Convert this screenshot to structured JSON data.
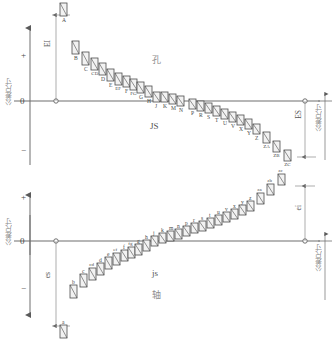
{
  "diagram": {
    "title_hole": "孔",
    "title_shaft": "轴",
    "axis_vertical_label": "公差尺寸",
    "zero_label": "0",
    "plus_label": "+",
    "minus_label": "−"
  },
  "hole": {
    "section_label": "孔",
    "js_label": "JS",
    "lower_dev_label": "EI",
    "upper_dev_label": "ES",
    "left_axis_label": "公差尺寸",
    "right_axis_label": "公差尺寸",
    "zero": "0",
    "plus": "+",
    "minus": "−",
    "zones": [
      {
        "letter": "A",
        "x": 60,
        "top": 3,
        "h": 13
      },
      {
        "letter": "B",
        "x": 72,
        "top": 41,
        "h": 13
      },
      {
        "letter": "C",
        "x": 82,
        "top": 52,
        "h": 13
      },
      {
        "letter": "CD",
        "x": 91,
        "top": 58,
        "h": 12
      },
      {
        "letter": "D",
        "x": 99,
        "top": 63,
        "h": 12
      },
      {
        "letter": "E",
        "x": 107,
        "top": 69,
        "h": 12
      },
      {
        "letter": "EF",
        "x": 115,
        "top": 73,
        "h": 12
      },
      {
        "letter": "F",
        "x": 123,
        "top": 76,
        "h": 11
      },
      {
        "letter": "FG",
        "x": 130,
        "top": 79,
        "h": 11
      },
      {
        "letter": "G",
        "x": 137,
        "top": 82,
        "h": 11
      },
      {
        "letter": "H",
        "x": 145,
        "top": 86,
        "h": 11
      },
      {
        "letter": "J",
        "x": 153,
        "top": 92,
        "h": 10
      },
      {
        "letter": "K",
        "x": 161,
        "top": 92,
        "h": 10
      },
      {
        "letter": "M",
        "x": 169,
        "top": 94,
        "h": 10
      },
      {
        "letter": "N",
        "x": 177,
        "top": 96,
        "h": 10
      },
      {
        "letter": "P",
        "x": 189,
        "top": 99,
        "h": 10
      },
      {
        "letter": "R",
        "x": 197,
        "top": 101,
        "h": 10
      },
      {
        "letter": "S",
        "x": 205,
        "top": 103,
        "h": 10
      },
      {
        "letter": "T",
        "x": 213,
        "top": 106,
        "h": 10
      },
      {
        "letter": "U",
        "x": 221,
        "top": 109,
        "h": 10
      },
      {
        "letter": "V",
        "x": 229,
        "top": 112,
        "h": 10
      },
      {
        "letter": "X",
        "x": 237,
        "top": 115,
        "h": 10
      },
      {
        "letter": "Y",
        "x": 245,
        "top": 119,
        "h": 10
      },
      {
        "letter": "Z",
        "x": 253,
        "top": 124,
        "h": 10
      },
      {
        "letter": "ZA",
        "x": 263,
        "top": 132,
        "h": 11
      },
      {
        "letter": "ZB",
        "x": 273,
        "top": 141,
        "h": 11
      },
      {
        "letter": "ZC",
        "x": 284,
        "top": 150,
        "h": 11
      }
    ]
  },
  "shaft": {
    "section_label": "轴",
    "js_label": "js",
    "upper_dev_label": "es",
    "lower_dev_label": "ei",
    "left_axis_label": "公差尺寸",
    "right_axis_label": "公差尺寸",
    "zero": "0",
    "plus": "+",
    "minus": "−",
    "zones": [
      {
        "letter": "a",
        "x": 60,
        "top": 325,
        "h": 13
      },
      {
        "letter": "b",
        "x": 70,
        "top": 285,
        "h": 13
      },
      {
        "letter": "c",
        "x": 80,
        "top": 274,
        "h": 13
      },
      {
        "letter": "cd",
        "x": 89,
        "top": 268,
        "h": 12
      },
      {
        "letter": "d",
        "x": 97,
        "top": 263,
        "h": 12
      },
      {
        "letter": "e",
        "x": 105,
        "top": 257,
        "h": 12
      },
      {
        "letter": "ef",
        "x": 113,
        "top": 253,
        "h": 12
      },
      {
        "letter": "f",
        "x": 121,
        "top": 250,
        "h": 11
      },
      {
        "letter": "fg",
        "x": 128,
        "top": 247,
        "h": 11
      },
      {
        "letter": "g",
        "x": 135,
        "top": 244,
        "h": 11
      },
      {
        "letter": "h",
        "x": 143,
        "top": 240,
        "h": 11
      },
      {
        "letter": "j",
        "x": 151,
        "top": 236,
        "h": 10
      },
      {
        "letter": "k",
        "x": 159,
        "top": 233,
        "h": 10
      },
      {
        "letter": "m",
        "x": 167,
        "top": 231,
        "h": 10
      },
      {
        "letter": "n",
        "x": 175,
        "top": 229,
        "h": 10
      },
      {
        "letter": "p",
        "x": 183,
        "top": 226,
        "h": 10
      },
      {
        "letter": "r",
        "x": 191,
        "top": 223,
        "h": 10
      },
      {
        "letter": "s",
        "x": 199,
        "top": 221,
        "h": 10
      },
      {
        "letter": "t",
        "x": 207,
        "top": 218,
        "h": 10
      },
      {
        "letter": "u",
        "x": 215,
        "top": 215,
        "h": 10
      },
      {
        "letter": "v",
        "x": 223,
        "top": 212,
        "h": 10
      },
      {
        "letter": "x",
        "x": 231,
        "top": 209,
        "h": 10
      },
      {
        "letter": "y",
        "x": 239,
        "top": 205,
        "h": 10
      },
      {
        "letter": "z",
        "x": 247,
        "top": 201,
        "h": 10
      },
      {
        "letter": "za",
        "x": 257,
        "top": 193,
        "h": 11
      },
      {
        "letter": "zb",
        "x": 267,
        "top": 184,
        "h": 11
      },
      {
        "letter": "zc",
        "x": 278,
        "top": 174,
        "h": 11
      }
    ]
  },
  "colors": {
    "line": "#6f6f6f",
    "zone_stroke": "#4d4d4d",
    "zone_fill": "#f2f2f2",
    "text": "#4a4a4a",
    "muted": "#8d8d8d"
  }
}
